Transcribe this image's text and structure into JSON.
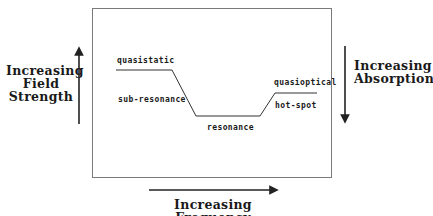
{
  "diagram": {
    "left_label": [
      "Increasing",
      "Field",
      "Strength"
    ],
    "right_label": [
      "Increasing",
      "Absorption"
    ],
    "bottom_label": "Increasing Frequency",
    "regimes": {
      "quasistatic": "quasistatic",
      "sub_resonance": "sub-resonance",
      "resonance": "resonance",
      "quasioptical": "quasioptical",
      "hot_spot": "hot-spot"
    },
    "arrows": {
      "left": "up",
      "right": "down",
      "bottom": "right"
    },
    "colors": {
      "line": "#333333",
      "frame": "#7a7a7a"
    }
  }
}
